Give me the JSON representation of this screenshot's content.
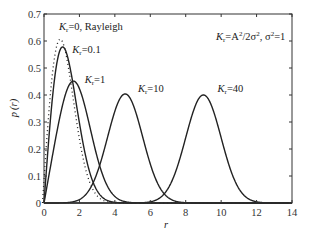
{
  "chart_data": {
    "type": "line",
    "title": "",
    "xlabel": "r",
    "ylabel": "p (r)",
    "xlim": [
      0,
      14
    ],
    "ylim": [
      0,
      0.7
    ],
    "xticks": [
      0,
      2,
      4,
      6,
      8,
      10,
      12,
      14
    ],
    "yticks": [
      0,
      0.1,
      0.2,
      0.3,
      0.4,
      0.5,
      0.6,
      0.7
    ],
    "xtick_labels": [
      "0",
      "2",
      "4",
      "6",
      "8",
      "10",
      "12",
      "14"
    ],
    "ytick_labels": [
      "0",
      "0.1",
      "0.2",
      "0.3",
      "0.4",
      "0.5",
      "0.6",
      "0.7"
    ],
    "grid": false,
    "legend": null,
    "formula_annotation": "K_r = A^2/2σ^2, σ^2 = 1",
    "series": [
      {
        "name": "K_r=0, Rayleigh",
        "K": 0,
        "style": "dotted",
        "peak_r": 1.0,
        "peak_p": 0.607
      },
      {
        "name": "K_r=0.1",
        "K": 0.1,
        "style": "solid",
        "peak_r": 1.05,
        "peak_p": 0.58
      },
      {
        "name": "K_r=1",
        "K": 1,
        "style": "solid",
        "peak_r": 1.7,
        "peak_p": 0.45
      },
      {
        "name": "K_r=10",
        "K": 10,
        "style": "solid",
        "peak_r": 4.5,
        "peak_p": 0.4
      },
      {
        "name": "K_r=40",
        "K": 40,
        "style": "solid",
        "peak_r": 9.0,
        "peak_p": 0.4
      }
    ],
    "annotations": [
      {
        "text_main": "K",
        "sub": "r",
        "rest": "=0, Rayleigh",
        "x": 0.85,
        "y": 0.64
      },
      {
        "text_main": "K",
        "sub": "r",
        "rest": "=0.1",
        "x": 1.6,
        "y": 0.555
      },
      {
        "text_main": "K",
        "sub": "r",
        "rest": "=1",
        "x": 2.3,
        "y": 0.445
      },
      {
        "text_main": "K",
        "sub": "r",
        "rest": "=10",
        "x": 5.3,
        "y": 0.41
      },
      {
        "text_main": "K",
        "sub": "r",
        "rest": "=40",
        "x": 9.8,
        "y": 0.41
      }
    ]
  },
  "labels": {
    "xlabel": "r",
    "ylabel_main": "p",
    "ylabel_paren": "(r)",
    "formula": {
      "k": "K",
      "sub": "r",
      "eq": "=A",
      "sup1": "2",
      "mid": "/2σ",
      "sup2": "2",
      "sep": ", σ",
      "sup3": "2",
      "end": "=1"
    }
  }
}
